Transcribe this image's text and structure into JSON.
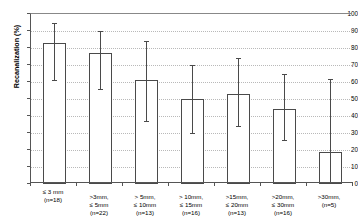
{
  "chart_data": {
    "type": "bar",
    "title": "",
    "xlabel": "",
    "ylabel": "Recanalization (%)",
    "ylim": [
      0,
      100
    ],
    "ytick_step": 10,
    "yticks": [
      0,
      10,
      20,
      30,
      40,
      50,
      60,
      70,
      80,
      90,
      100
    ],
    "grid": true,
    "legend": "none",
    "error_bar_style": "vertical line with caps",
    "categories": [
      "≤ 3 mm (n=18)",
      ">3mm, ≤ 5mm (n=22)",
      "> 5mm, ≤ 10mm (n=13)",
      "> 10mm, ≤ 15mm (n=16)",
      ">15mm, ≤ 20mm (n=13)",
      ">20mm, ≤ 30mm (n=16)",
      ">30mm, (n=5)"
    ],
    "category_lines": [
      [
        "≤ 3 mm",
        "(n=18)"
      ],
      [
        ">3mm,",
        "≤ 5mm",
        "(n=22)"
      ],
      [
        "> 5mm,",
        "≤ 10mm",
        "(n=13)"
      ],
      [
        "> 10mm,",
        "≤ 15mm",
        "(n=16)"
      ],
      [
        ">15mm,",
        "≤ 20mm",
        "(n=13)"
      ],
      [
        ">20mm,",
        "≤ 30mm",
        "(n=16)"
      ],
      [
        ">30mm,",
        "(n=5)"
      ]
    ],
    "group_sizes": [
      18,
      22,
      13,
      16,
      13,
      16,
      5
    ],
    "values": [
      83,
      77,
      61,
      50,
      53,
      44,
      19
    ],
    "error_low": [
      61,
      56,
      37,
      30,
      34,
      26,
      0
    ],
    "error_high": [
      95,
      90,
      84,
      70,
      74,
      65,
      62
    ],
    "colors": {
      "bar_fill": "#ffffff",
      "bar_edge": "#4a4a4a",
      "error_bar": "#4a4a4a",
      "axis": "#555555",
      "gridline": "#b9b9b9",
      "text": "#000000",
      "background": "#ffffff"
    }
  }
}
